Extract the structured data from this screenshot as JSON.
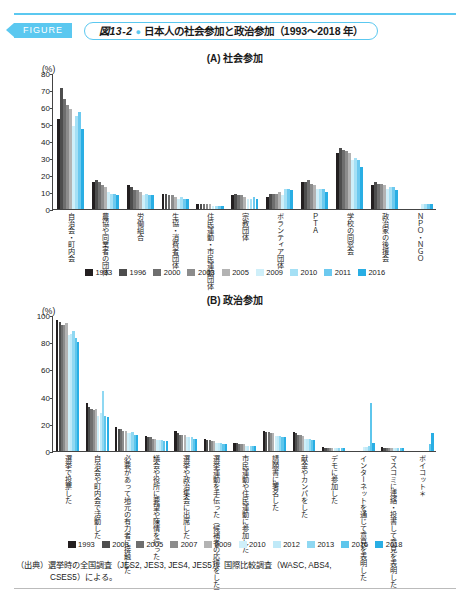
{
  "header": {
    "figure_tag": "FIGURE",
    "figure_number": "図13-2",
    "title": "日本人の社会参加と政治参加（1993〜2018 年）"
  },
  "source": {
    "line1": "（出典）選挙時の全国調査（JES2, JES3, JES4, JES5）、国際比較調査（WASC, ABS4,",
    "line2": "CSES5）による。"
  },
  "chart_data": [
    {
      "type": "bar",
      "panel_id": "A",
      "title": "(A) 社会参加",
      "ylabel": "(%)",
      "ylim": [
        0,
        80
      ],
      "yticks": [
        0,
        10,
        20,
        30,
        40,
        50,
        60,
        70,
        80
      ],
      "grid": false,
      "legend_position": "bottom",
      "categories": [
        "自治会・町内会",
        "農協や同業者の団体",
        "労働組合",
        "生協・消費者団体",
        "住民運動・市民運動団体",
        "宗教団体",
        "ボランティア団体",
        "ＰＴＡ",
        "学校の同窓会",
        "政治家の後援会",
        "ＮＰＯ・ＮＧＯ"
      ],
      "series": [
        {
          "name": "1993",
          "color": "#231f20",
          "values": [
            53,
            16,
            14,
            9,
            3,
            8,
            7,
            16,
            33,
            14,
            0
          ]
        },
        {
          "name": "1996",
          "color": "#4d4d4d",
          "values": [
            71,
            17,
            13,
            9,
            3,
            9,
            9,
            16,
            36,
            16,
            0
          ]
        },
        {
          "name": "2000",
          "color": "#6e6e6e",
          "values": [
            65,
            16,
            11,
            8,
            3,
            8,
            9,
            17,
            35,
            15,
            0
          ]
        },
        {
          "name": "2003",
          "color": "#8c8c8c",
          "values": [
            61,
            14,
            11,
            8,
            3,
            8,
            9,
            15,
            34,
            15,
            0
          ]
        },
        {
          "name": "2005",
          "color": "#b3b3b3",
          "values": [
            59,
            13,
            10,
            7,
            3,
            7,
            10,
            14,
            33,
            14,
            0
          ]
        },
        {
          "name": "2009",
          "color": "#cfeff9",
          "values": [
            49,
            10,
            8,
            6,
            2,
            6,
            8,
            12,
            29,
            12,
            3
          ]
        },
        {
          "name": "2010",
          "color": "#a5e0f5",
          "values": [
            55,
            9,
            9,
            7,
            2,
            6,
            12,
            12,
            30,
            13,
            3
          ]
        },
        {
          "name": "2011",
          "color": "#6cc9ef",
          "values": [
            57,
            9,
            8,
            6,
            2,
            7,
            12,
            12,
            29,
            13,
            3
          ]
        },
        {
          "name": "2016",
          "color": "#29aee4",
          "values": [
            47,
            8,
            8,
            6,
            2,
            6,
            11,
            10,
            25,
            11,
            3
          ]
        }
      ]
    },
    {
      "type": "bar",
      "panel_id": "B",
      "title": "(B) 政治参加",
      "ylabel": "(%)",
      "ylim": [
        0,
        100
      ],
      "yticks": [
        0,
        20,
        40,
        60,
        80,
        100
      ],
      "grid": false,
      "legend_position": "bottom",
      "categories": [
        "選挙で投票した",
        "自治会や町内会で活動した",
        "必要があって地元の有力者に接触した",
        "議会や役所に要望や陳情を行った",
        "選挙や政治集会に出席した",
        "選挙運動を手伝った（候補者の応援をした）",
        "市民運動や住民運動に参加した",
        "請願書に署名した",
        "献金やカンパをした",
        "デモに参加した",
        "インターネットを通じて意見を表明した",
        "マスコミに連絡・投書して意見を表明した",
        "ボイコット＊"
      ],
      "series": [
        {
          "name": "1993",
          "color": "#231f20",
          "values": [
            96,
            35,
            18,
            11,
            15,
            9,
            6,
            15,
            14,
            3,
            0,
            3,
            0
          ]
        },
        {
          "name": "2003",
          "color": "#4d4d4d",
          "values": [
            95,
            32,
            16,
            10,
            13,
            8,
            6,
            14,
            13,
            2,
            0,
            2,
            0
          ]
        },
        {
          "name": "2005",
          "color": "#6e6e6e",
          "values": [
            93,
            31,
            16,
            10,
            12,
            8,
            5,
            14,
            12,
            2,
            0,
            2,
            0
          ]
        },
        {
          "name": "2007",
          "color": "#8c8c8c",
          "values": [
            93,
            30,
            15,
            9,
            12,
            7,
            5,
            13,
            12,
            2,
            0,
            2,
            0
          ]
        },
        {
          "name": "2009",
          "color": "#b3b3b3",
          "values": [
            94,
            31,
            15,
            9,
            12,
            7,
            5,
            13,
            11,
            2,
            0,
            2,
            0
          ]
        },
        {
          "name": "2010",
          "color": "#cfeff9",
          "values": [
            85,
            26,
            13,
            8,
            10,
            6,
            4,
            11,
            9,
            2,
            3,
            2,
            0
          ]
        },
        {
          "name": "2012",
          "color": "#bfe9f8",
          "values": [
            86,
            28,
            13,
            8,
            10,
            6,
            4,
            11,
            9,
            2,
            3,
            2,
            0
          ]
        },
        {
          "name": "2013",
          "color": "#8fd8f2",
          "values": [
            88,
            44,
            14,
            8,
            10,
            6,
            4,
            11,
            9,
            2,
            4,
            2,
            0
          ]
        },
        {
          "name": "2016",
          "color": "#5ec6ec",
          "values": [
            83,
            26,
            12,
            7,
            9,
            5,
            4,
            10,
            8,
            2,
            35,
            2,
            5
          ]
        },
        {
          "name": "2018",
          "color": "#29aee4",
          "values": [
            80,
            25,
            12,
            7,
            9,
            5,
            4,
            10,
            8,
            2,
            6,
            2,
            13
          ]
        }
      ]
    }
  ]
}
